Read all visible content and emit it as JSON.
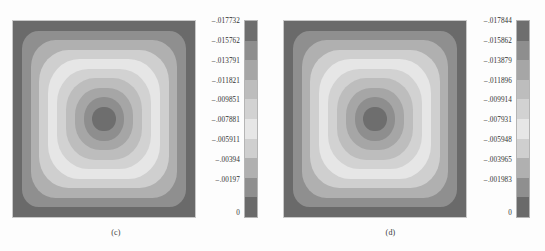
{
  "figure": {
    "background": "#fdfdfd",
    "panel_count": 2
  },
  "palette": {
    "note": "10 discrete grayscale contour levels, index 0 = most negative (darkest top of colorbar), index 9 = zero (dark bottom)",
    "levels": [
      "#6e6e6e",
      "#8e8e8e",
      "#a6a6a6",
      "#bdbdbd",
      "#d2d2d2",
      "#e6e6e6",
      "#cfcfcf",
      "#b0b0b0",
      "#8f8f8f",
      "#6a6a6a"
    ]
  },
  "chart_data": [
    {
      "type": "heatmap",
      "id": "panel-c",
      "caption": "(c)",
      "title": "",
      "xlabel": "",
      "ylabel": "",
      "colorbar": {
        "orientation": "vertical",
        "position": "right",
        "discrete": true,
        "n_levels": 10,
        "vmin": -0.017732,
        "vmax": 0,
        "tick_labels": [
          "-.017732",
          "-.015762",
          "-.013791",
          "-.011821",
          "-.009851",
          "-.007881",
          "-.005911",
          "-.00394",
          "-.00197",
          "0"
        ],
        "tick_values": [
          -0.017732,
          -0.015762,
          -0.013791,
          -0.011821,
          -0.009851,
          -0.007881,
          -0.005911,
          -0.00394,
          -0.00197,
          0
        ]
      },
      "field": {
        "description": "Concentric rounded-square contour bands on a square domain; extreme (most negative) value at the domain centre, zero at the boundary.",
        "center_value": -0.017732,
        "boundary_value": 0,
        "symmetry": "four-fold, centred"
      }
    },
    {
      "type": "heatmap",
      "id": "panel-d",
      "caption": "(d)",
      "title": "",
      "xlabel": "",
      "ylabel": "",
      "colorbar": {
        "orientation": "vertical",
        "position": "right",
        "discrete": true,
        "n_levels": 10,
        "vmin": -0.017844,
        "vmax": 0,
        "tick_labels": [
          "-.017844",
          "-.015862",
          "-.013879",
          "-.011896",
          "-.009914",
          "-.007931",
          "-.005948",
          "-.003965",
          "-.001983",
          "0"
        ],
        "tick_values": [
          -0.017844,
          -0.015862,
          -0.013879,
          -0.011896,
          -0.009914,
          -0.007931,
          -0.005948,
          -0.003965,
          -0.001983,
          0
        ]
      },
      "field": {
        "description": "Concentric rounded-square contour bands on a square domain; extreme (most negative) value at the domain centre, zero at the boundary.",
        "center_value": -0.017844,
        "boundary_value": 0,
        "symmetry": "four-fold, centred"
      }
    }
  ]
}
